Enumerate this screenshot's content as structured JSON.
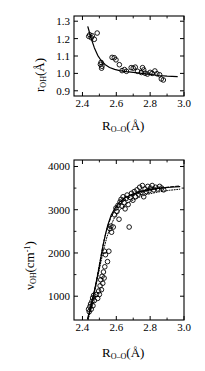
{
  "figure": {
    "background": "#ffffff",
    "ink": "#000000",
    "marker": "open-circle"
  },
  "chart_data": [
    {
      "id": "top-panel",
      "type": "scatter",
      "title": "",
      "xlabel": "R_O--O (A)",
      "ylabel": "r_OH (A)",
      "xlabel_parts": {
        "base": "R",
        "sub": "O--O",
        "unit": "(Å)"
      },
      "ylabel_parts": {
        "base": "r",
        "sub": "OH",
        "unit": "(Å)"
      },
      "xlim": [
        2.35,
        3.0
      ],
      "ylim": [
        0.87,
        1.33
      ],
      "xticks": [
        2.4,
        2.6,
        2.8,
        3.0
      ],
      "xticklabels": [
        "2.4",
        "2.6",
        "2.8",
        "3.0"
      ],
      "xminor": [
        2.5,
        2.7,
        2.9
      ],
      "yticks": [
        0.9,
        1.0,
        1.1,
        1.2,
        1.3
      ],
      "yticklabels": [
        "0.9",
        "1.0",
        "1.1",
        "1.2",
        "1.3"
      ],
      "grid": false,
      "legend": false,
      "points": [
        {
          "x": 2.437,
          "y": 1.213
        },
        {
          "x": 2.443,
          "y": 1.222
        },
        {
          "x": 2.452,
          "y": 1.205
        },
        {
          "x": 2.458,
          "y": 1.216
        },
        {
          "x": 2.47,
          "y": 1.196
        },
        {
          "x": 2.487,
          "y": 1.232
        },
        {
          "x": 2.506,
          "y": 1.052
        },
        {
          "x": 2.51,
          "y": 1.063
        },
        {
          "x": 2.513,
          "y": 1.03
        },
        {
          "x": 2.515,
          "y": 1.041
        },
        {
          "x": 2.575,
          "y": 1.092
        },
        {
          "x": 2.588,
          "y": 1.09
        },
        {
          "x": 2.598,
          "y": 1.078
        },
        {
          "x": 2.618,
          "y": 1.05
        },
        {
          "x": 2.634,
          "y": 1.016
        },
        {
          "x": 2.648,
          "y": 1.022
        },
        {
          "x": 2.66,
          "y": 1.012
        },
        {
          "x": 2.688,
          "y": 1.033
        },
        {
          "x": 2.7,
          "y": 1.03
        },
        {
          "x": 2.712,
          "y": 1.036
        },
        {
          "x": 2.726,
          "y": 1.012
        },
        {
          "x": 2.748,
          "y": 1.005
        },
        {
          "x": 2.755,
          "y": 1.033
        },
        {
          "x": 2.762,
          "y": 1.02
        },
        {
          "x": 2.77,
          "y": 1.001
        },
        {
          "x": 2.784,
          "y": 0.996
        },
        {
          "x": 2.8,
          "y": 1.006
        },
        {
          "x": 2.812,
          "y": 1.0
        },
        {
          "x": 2.828,
          "y": 1.014
        },
        {
          "x": 2.84,
          "y": 0.998
        },
        {
          "x": 2.856,
          "y": 0.992
        },
        {
          "x": 2.866,
          "y": 0.968
        },
        {
          "x": 2.878,
          "y": 0.962
        }
      ],
      "curves": [
        {
          "name": "fit",
          "style": "solid",
          "points": [
            {
              "x": 2.432,
              "y": 1.268
            },
            {
              "x": 2.45,
              "y": 1.205
            },
            {
              "x": 2.47,
              "y": 1.148
            },
            {
              "x": 2.49,
              "y": 1.104
            },
            {
              "x": 2.51,
              "y": 1.074
            },
            {
              "x": 2.535,
              "y": 1.05
            },
            {
              "x": 2.56,
              "y": 1.034
            },
            {
              "x": 2.59,
              "y": 1.023
            },
            {
              "x": 2.62,
              "y": 1.016
            },
            {
              "x": 2.66,
              "y": 1.01
            },
            {
              "x": 2.7,
              "y": 1.006
            },
            {
              "x": 2.75,
              "y": 1.0
            },
            {
              "x": 2.8,
              "y": 0.994
            },
            {
              "x": 2.85,
              "y": 0.988
            },
            {
              "x": 2.9,
              "y": 0.984
            },
            {
              "x": 2.96,
              "y": 0.981
            }
          ]
        }
      ]
    },
    {
      "id": "bottom-panel",
      "type": "scatter",
      "title": "",
      "xlabel": "R_O--O (A)",
      "ylabel": "nu_OH (cm^-1)",
      "xlabel_parts": {
        "base": "R",
        "sub": "O--O",
        "unit": "(Å)"
      },
      "ylabel_parts": {
        "base": "ν",
        "sub": "OH",
        "unit": "(cm",
        "sup": "-1",
        "unit_close": ")"
      },
      "xlim": [
        2.35,
        3.0
      ],
      "ylim": [
        450,
        4150
      ],
      "xticks": [
        2.4,
        2.6,
        2.8,
        3.0
      ],
      "xticklabels": [
        "2.4",
        "2.6",
        "2.8",
        "3.0"
      ],
      "xminor": [
        2.5,
        2.7,
        2.9
      ],
      "yticks": [
        1000,
        2000,
        3000,
        4000
      ],
      "yticklabels": [
        "1000",
        "2000",
        "3000",
        "4000"
      ],
      "yminor": [
        1500,
        2500,
        3500
      ],
      "grid": false,
      "legend": false,
      "points": [
        {
          "x": 2.436,
          "y": 700
        },
        {
          "x": 2.44,
          "y": 640
        },
        {
          "x": 2.444,
          "y": 760
        },
        {
          "x": 2.448,
          "y": 820
        },
        {
          "x": 2.452,
          "y": 700
        },
        {
          "x": 2.456,
          "y": 880
        },
        {
          "x": 2.46,
          "y": 960
        },
        {
          "x": 2.462,
          "y": 780
        },
        {
          "x": 2.466,
          "y": 1020
        },
        {
          "x": 2.47,
          "y": 900
        },
        {
          "x": 2.482,
          "y": 1040
        },
        {
          "x": 2.49,
          "y": 950
        },
        {
          "x": 2.496,
          "y": 1120
        },
        {
          "x": 2.5,
          "y": 1040
        },
        {
          "x": 2.504,
          "y": 1240
        },
        {
          "x": 2.508,
          "y": 1380
        },
        {
          "x": 2.512,
          "y": 1150
        },
        {
          "x": 2.516,
          "y": 1460
        },
        {
          "x": 2.52,
          "y": 1300
        },
        {
          "x": 2.524,
          "y": 1560
        },
        {
          "x": 2.528,
          "y": 1420
        },
        {
          "x": 2.532,
          "y": 1680
        },
        {
          "x": 2.536,
          "y": 1960
        },
        {
          "x": 2.53,
          "y": 2040
        },
        {
          "x": 2.548,
          "y": 1800
        },
        {
          "x": 2.556,
          "y": 2040
        },
        {
          "x": 2.562,
          "y": 2560
        },
        {
          "x": 2.568,
          "y": 2620
        },
        {
          "x": 2.572,
          "y": 2480
        },
        {
          "x": 2.582,
          "y": 2600
        },
        {
          "x": 2.59,
          "y": 2880
        },
        {
          "x": 2.598,
          "y": 3040
        },
        {
          "x": 2.604,
          "y": 2960
        },
        {
          "x": 2.61,
          "y": 3100
        },
        {
          "x": 2.616,
          "y": 2780
        },
        {
          "x": 2.622,
          "y": 3180
        },
        {
          "x": 2.628,
          "y": 3240
        },
        {
          "x": 2.634,
          "y": 3080
        },
        {
          "x": 2.64,
          "y": 3300
        },
        {
          "x": 2.646,
          "y": 3160
        },
        {
          "x": 2.652,
          "y": 3020
        },
        {
          "x": 2.658,
          "y": 3260
        },
        {
          "x": 2.664,
          "y": 3340
        },
        {
          "x": 2.67,
          "y": 3120
        },
        {
          "x": 2.676,
          "y": 2600
        },
        {
          "x": 2.684,
          "y": 3280
        },
        {
          "x": 2.69,
          "y": 3380
        },
        {
          "x": 2.698,
          "y": 3220
        },
        {
          "x": 2.706,
          "y": 3420
        },
        {
          "x": 2.714,
          "y": 3300
        },
        {
          "x": 2.722,
          "y": 3460
        },
        {
          "x": 2.73,
          "y": 3360
        },
        {
          "x": 2.738,
          "y": 3520
        },
        {
          "x": 2.746,
          "y": 3400
        },
        {
          "x": 2.754,
          "y": 3560
        },
        {
          "x": 2.762,
          "y": 3300
        },
        {
          "x": 2.77,
          "y": 3480
        },
        {
          "x": 2.778,
          "y": 3420
        },
        {
          "x": 2.786,
          "y": 3540
        },
        {
          "x": 2.794,
          "y": 3440
        },
        {
          "x": 2.802,
          "y": 3500
        },
        {
          "x": 2.812,
          "y": 3560
        },
        {
          "x": 2.822,
          "y": 3460
        },
        {
          "x": 2.832,
          "y": 3520
        },
        {
          "x": 2.844,
          "y": 3480
        },
        {
          "x": 2.856,
          "y": 3540
        },
        {
          "x": 2.868,
          "y": 3500
        },
        {
          "x": 2.88,
          "y": 3460
        }
      ],
      "curves": [
        {
          "name": "fit-solid",
          "style": "solid",
          "points": [
            {
              "x": 2.43,
              "y": 480
            },
            {
              "x": 2.445,
              "y": 700
            },
            {
              "x": 2.46,
              "y": 950
            },
            {
              "x": 2.475,
              "y": 1200
            },
            {
              "x": 2.49,
              "y": 1480
            },
            {
              "x": 2.505,
              "y": 1800
            },
            {
              "x": 2.52,
              "y": 2140
            },
            {
              "x": 2.535,
              "y": 2420
            },
            {
              "x": 2.55,
              "y": 2650
            },
            {
              "x": 2.57,
              "y": 2880
            },
            {
              "x": 2.59,
              "y": 3020
            },
            {
              "x": 2.62,
              "y": 3180
            },
            {
              "x": 2.65,
              "y": 3270
            },
            {
              "x": 2.69,
              "y": 3350
            },
            {
              "x": 2.74,
              "y": 3420
            },
            {
              "x": 2.8,
              "y": 3470
            },
            {
              "x": 2.86,
              "y": 3500
            },
            {
              "x": 2.92,
              "y": 3520
            },
            {
              "x": 2.975,
              "y": 3535
            }
          ]
        },
        {
          "name": "fit-dashed",
          "style": "dashed",
          "points": [
            {
              "x": 2.432,
              "y": 470
            },
            {
              "x": 2.448,
              "y": 720
            },
            {
              "x": 2.464,
              "y": 1010
            },
            {
              "x": 2.48,
              "y": 1320
            },
            {
              "x": 2.496,
              "y": 1650
            },
            {
              "x": 2.512,
              "y": 1990
            },
            {
              "x": 2.528,
              "y": 2300
            },
            {
              "x": 2.546,
              "y": 2580
            },
            {
              "x": 2.566,
              "y": 2800
            },
            {
              "x": 2.59,
              "y": 2980
            },
            {
              "x": 2.62,
              "y": 3130
            },
            {
              "x": 2.66,
              "y": 3250
            },
            {
              "x": 2.71,
              "y": 3350
            },
            {
              "x": 2.77,
              "y": 3430
            },
            {
              "x": 2.84,
              "y": 3490
            },
            {
              "x": 2.91,
              "y": 3525
            },
            {
              "x": 2.975,
              "y": 3550
            }
          ]
        },
        {
          "name": "fit-dotted",
          "style": "dotted",
          "points": [
            {
              "x": 2.434,
              "y": 460
            },
            {
              "x": 2.452,
              "y": 740
            },
            {
              "x": 2.47,
              "y": 1060
            },
            {
              "x": 2.488,
              "y": 1400
            },
            {
              "x": 2.506,
              "y": 1740
            },
            {
              "x": 2.524,
              "y": 2060
            },
            {
              "x": 2.544,
              "y": 2360
            },
            {
              "x": 2.566,
              "y": 2620
            },
            {
              "x": 2.592,
              "y": 2840
            },
            {
              "x": 2.626,
              "y": 3020
            },
            {
              "x": 2.668,
              "y": 3160
            },
            {
              "x": 2.716,
              "y": 3260
            },
            {
              "x": 2.776,
              "y": 3350
            },
            {
              "x": 2.846,
              "y": 3410
            },
            {
              "x": 2.915,
              "y": 3450
            },
            {
              "x": 2.975,
              "y": 3475
            }
          ]
        }
      ]
    }
  ]
}
